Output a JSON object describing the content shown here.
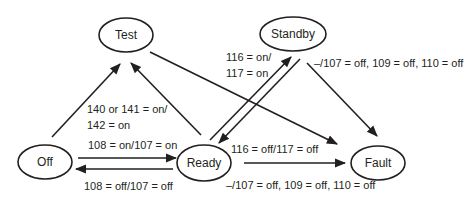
{
  "diagram": {
    "type": "state-machine",
    "nodes": [
      {
        "id": "test",
        "label": "Test"
      },
      {
        "id": "standby",
        "label": "Standby"
      },
      {
        "id": "off",
        "label": "Off"
      },
      {
        "id": "ready",
        "label": "Ready"
      },
      {
        "id": "fault",
        "label": "Fault"
      }
    ],
    "edges": [
      {
        "from": "off",
        "to": "test",
        "label_line1": "140 or 141 = on/",
        "label_line2": "142 = on"
      },
      {
        "from": "ready",
        "to": "test",
        "label": ""
      },
      {
        "from": "test",
        "to": "fault",
        "label": ""
      },
      {
        "from": "ready",
        "to": "standby",
        "label_line1": "116 = on/",
        "label_line2": "117 = on"
      },
      {
        "from": "standby",
        "to": "ready",
        "label": "116 = off/117 = off"
      },
      {
        "from": "standby",
        "to": "fault",
        "label": "–/107 = off, 109 = off, 110 = off"
      },
      {
        "from": "off",
        "to": "ready",
        "label": "108 = on/107 = on"
      },
      {
        "from": "ready",
        "to": "off",
        "label": "108 = off/107 = off"
      },
      {
        "from": "ready",
        "to": "fault",
        "label": "–/107 = off, 109 = off, 110 = off"
      }
    ]
  }
}
